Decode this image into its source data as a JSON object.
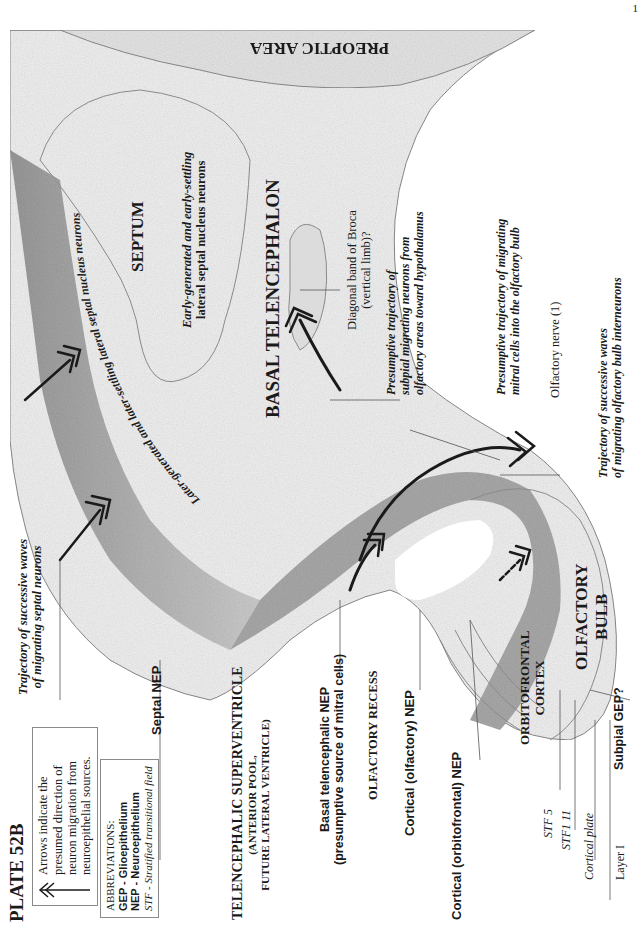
{
  "plate": {
    "title": "PLATE 52B",
    "page_marker": "1",
    "orientation": "rotated 90° counter-clockwise"
  },
  "legend": {
    "arrow_note": {
      "icon": "double-chevron-arrow-icon",
      "lines": [
        "Arrows indicate the",
        "presumed direction of",
        "neuron migration from",
        "neuroepithelial sources."
      ]
    },
    "abbreviations": {
      "heading": "ABBREVIATIONS:",
      "items": [
        "GEP - Glioepithelium",
        "NEP - Neuroepithelium",
        "STF - Stratified transitional field"
      ]
    }
  },
  "regions": {
    "preoptic_area": "PREOPTIC AREA",
    "septum": "SEPTUM",
    "basal_telencephalon": "BASAL TELENCEPHALON",
    "olfactory_bulb": [
      "OLFACTORY",
      "BULB"
    ],
    "orbitofrontal_cortex": [
      "ORBITOFRONTAL",
      "CORTEX"
    ],
    "supraventricle": {
      "title": "TELENCEPHALIC SUPERVENTRICLE",
      "sub1": "(ANTERIOR POOL,",
      "sub2": "FUTURE LATERAL VENTRICLE)"
    },
    "olfactory_recess": "OLFACTORY RECESS"
  },
  "annotations": {
    "early_septal": [
      "Early-generated and early-settling",
      "lateral septal nucleus neurons"
    ],
    "later_septal": "Later-generated and later-settling lateral septal nucleus neurons",
    "trajectory_septal": [
      "Trajectory of successive waves",
      "of migrating septal neurons"
    ],
    "diagonal_band": [
      "Diagonal band of Broca",
      "(vertical limb)?"
    ],
    "subpial_trajectory": [
      "Presumptive trajectory of",
      "subpial migrating neurons from",
      "olfactory areas toward hypothalamus"
    ],
    "mitral_trajectory": [
      "Presumptive trajectory of migrating",
      "mitral cells into the olfactory bulb"
    ],
    "olfactory_nerve": "Olfactory nerve (1)",
    "bulb_interneurons": [
      "Trajectory of successive waves",
      "of migrating olfactory bulb interneurons"
    ],
    "septal_nep": "Septal NEP",
    "basal_nep": [
      "Basal telencephalic NEP",
      "(presumptive source of mitral cells)"
    ],
    "cortical_olfactory_nep": "Cortical (olfactory) NEP",
    "cortical_orbitofrontal_nep": "Cortical (orbitofrontal) NEP",
    "subpial_gep": "Subpial GEP?",
    "stf5": "STF 5",
    "stf11": "STF1 11",
    "cortical_plate": "Cortical plate",
    "layer1": "Layer I"
  },
  "colors": {
    "tissue_light": "#ececec",
    "tissue_mid": "#cfcfcf",
    "neuroepithelium_dark": "#9a9a9a",
    "outline": "#7a7a7a",
    "arrow": "#1a1a1a",
    "text": "#1a1a1a"
  }
}
